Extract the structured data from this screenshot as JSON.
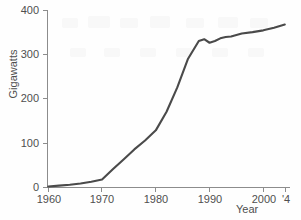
{
  "chart_data": {
    "type": "line",
    "title": "",
    "subtitle": "",
    "xlabel": "Year",
    "ylabel": "Gigawatts",
    "xlim": [
      1960,
      2004
    ],
    "ylim": [
      0,
      400
    ],
    "grid": false,
    "legend": "none",
    "line_color": "#4a4a4a",
    "axis_color": "#8c8c8c",
    "series": [
      {
        "name": "Nuclear generating capacity",
        "x": [
          1960,
          1962,
          1964,
          1966,
          1968,
          1970,
          1972,
          1974,
          1976,
          1978,
          1980,
          1982,
          1984,
          1986,
          1988,
          1989,
          1990,
          1991,
          1992,
          1993,
          1994,
          1996,
          1998,
          2000,
          2002,
          2004
        ],
        "values": [
          1,
          3,
          5,
          8,
          12,
          17,
          40,
          62,
          85,
          105,
          128,
          170,
          225,
          290,
          330,
          334,
          326,
          330,
          336,
          339,
          340,
          347,
          350,
          354,
          360,
          367
        ]
      }
    ],
    "x_ticks": [
      {
        "value": 1960,
        "label": "1960"
      },
      {
        "value": 1970,
        "label": "1970"
      },
      {
        "value": 1980,
        "label": "1980"
      },
      {
        "value": 1990,
        "label": "1990"
      },
      {
        "value": 2000,
        "label": "2000"
      },
      {
        "value": 2004,
        "label": "'4"
      }
    ],
    "y_ticks": [
      {
        "value": 0,
        "label": "0"
      },
      {
        "value": 100,
        "label": "100"
      },
      {
        "value": 200,
        "label": "200"
      },
      {
        "value": 300,
        "label": "300"
      },
      {
        "value": 400,
        "label": "400"
      }
    ]
  },
  "axes": {
    "ylabel": "Gigawatts",
    "xlabel": "Year"
  },
  "yticks": {
    "t0": "0",
    "t1": "100",
    "t2": "200",
    "t3": "300",
    "t4": "400"
  },
  "xticks": {
    "t0": "1960",
    "t1": "1970",
    "t2": "1980",
    "t3": "1990",
    "t4": "2000",
    "t5": "'4"
  }
}
